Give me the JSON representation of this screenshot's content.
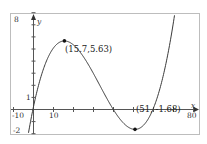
{
  "chart_data": {
    "type": "line",
    "title": "",
    "xlabel": "x",
    "ylabel": "y",
    "xlim": [
      -10,
      80
    ],
    "ylim": [
      -2,
      8
    ],
    "grid": false,
    "x_tick_labels": [
      "-10",
      "10",
      "80"
    ],
    "y_tick_labels": [
      "8",
      "1",
      "-2"
    ],
    "x_tick_step": 10,
    "y_tick_step": 1,
    "series": [
      {
        "name": "cubic",
        "function": "f(x) = 0.0003324*(x^3 - 100.05x^2 + 2402.1x)",
        "color": "#333333"
      }
    ],
    "annotations": [
      {
        "label": "(15.7, 5.63)",
        "x": 15.7,
        "y": 5.63,
        "kind": "local maximum"
      },
      {
        "label": "(51, -1.68)",
        "x": 51,
        "y": -1.68,
        "kind": "local minimum"
      }
    ]
  },
  "labels": {
    "x_axis": "x",
    "y_axis": "y",
    "x_min": "-10",
    "x_ten": "10",
    "x_max": "80",
    "y_max": "8",
    "y_one": "1",
    "y_min": "-2",
    "max_point": "(15.7,5.63)",
    "min_point": "(51, -1.68)"
  }
}
